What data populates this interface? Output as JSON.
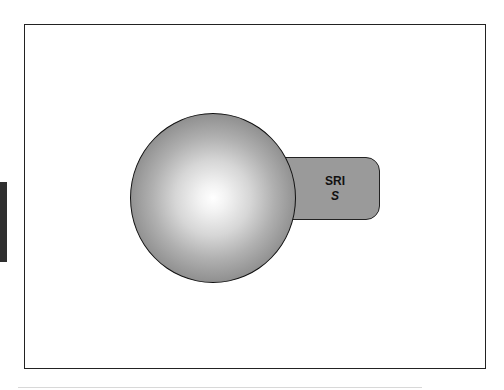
{
  "diagram": {
    "shapes": [
      {
        "type": "sphere",
        "fill": "radial-gradient white to gray"
      },
      {
        "type": "rounded-tab",
        "fill": "#9a9a9a"
      }
    ],
    "tab_label": {
      "line1": "SRI",
      "line2": "S"
    },
    "colors": {
      "tab_fill": "#9a9a9a",
      "sphere_edge": "#858585",
      "sphere_center": "#ffffff",
      "outline": "#222222",
      "side_bar": "#2f2f2f"
    }
  }
}
